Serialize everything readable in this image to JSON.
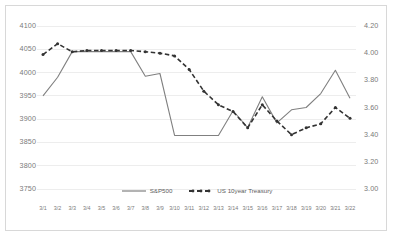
{
  "chart_data": {
    "type": "line",
    "title": "",
    "xlabel": "",
    "ylabel": "",
    "grid": true,
    "legend_position": "bottom-center",
    "categories": [
      "3/1",
      "3/2",
      "3/3",
      "3/4",
      "3/5",
      "3/6",
      "3/7",
      "3/8",
      "3/9",
      "3/10",
      "3/11",
      "3/12",
      "3/13",
      "3/14",
      "3/15",
      "3/16",
      "3/17",
      "3/18",
      "3/19",
      "3/20",
      "3/21",
      "3/22"
    ],
    "axes": {
      "left": {
        "name": "S&P500",
        "ylim": [
          3750,
          4100
        ],
        "ticks": [
          4100,
          4050,
          4000,
          3950,
          3900,
          3850,
          3800,
          3750
        ],
        "tick_labels": [
          "4100",
          "4050",
          "4000",
          "3950",
          "3900",
          "3850",
          "3800",
          "3750"
        ]
      },
      "right": {
        "name": "US 10year Treasury",
        "ylim": [
          3.0,
          4.2
        ],
        "ticks": [
          4.2,
          4.0,
          3.8,
          3.6,
          3.4,
          3.2,
          3.0
        ],
        "tick_labels": [
          "4.20",
          "4.00",
          "3.80",
          "3.60",
          "3.40",
          "3.20",
          "3.00"
        ]
      }
    },
    "series": [
      {
        "name": "S&P500",
        "axis": "left",
        "style": "solid",
        "color": "#808080",
        "markers": false,
        "values": [
          3950,
          3990,
          4045,
          4045,
          4045,
          4045,
          4045,
          3992,
          3998,
          3865,
          3865,
          3865,
          3865,
          3918,
          3882,
          3948,
          3892,
          3920,
          3925,
          3955,
          4005,
          3945
        ]
      },
      {
        "name": "US 10year Treasury",
        "axis": "right",
        "style": "dashed",
        "color": "#333333",
        "markers": true,
        "values": [
          3.99,
          4.07,
          4.01,
          4.02,
          4.02,
          4.02,
          4.02,
          4.01,
          4.0,
          3.98,
          3.88,
          3.72,
          3.62,
          3.57,
          3.45,
          3.62,
          3.5,
          3.4,
          3.45,
          3.48,
          3.6,
          3.52
        ]
      }
    ]
  },
  "legend": {
    "items": [
      {
        "label": "S&P500",
        "style": "solid"
      },
      {
        "label": "US 10year Treasury",
        "style": "dashed"
      }
    ]
  }
}
